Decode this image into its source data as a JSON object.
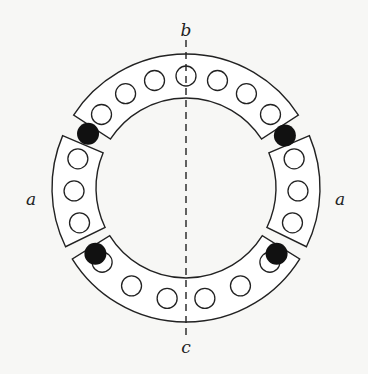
{
  "diagram": {
    "type": "rotor-stator cross-section",
    "center": [
      186,
      188
    ],
    "outer_radius": 134,
    "inner_radius": 90,
    "conductor_radius": 10,
    "conductor_ring_radius": 112,
    "stroke_color": "#222222",
    "fill_color": "#ffffff",
    "dot_color": "#111111",
    "segments": [
      {
        "name": "top",
        "start_deg": 33,
        "end_deg": 147,
        "conductors": 7
      },
      {
        "name": "left",
        "start_deg": 157,
        "end_deg": 206,
        "conductors": 3
      },
      {
        "name": "bottom",
        "start_deg": 212,
        "end_deg": 328,
        "conductors": 6
      },
      {
        "name": "right",
        "start_deg": -26,
        "end_deg": 23,
        "conductors": 3
      }
    ],
    "black_dots_deg": [
      28,
      151,
      216,
      324
    ],
    "axis": {
      "style": "dashed",
      "from_label": "b",
      "to_label": "c"
    },
    "labels": {
      "top": "b",
      "bottom": "c",
      "left": "a",
      "right": "a"
    }
  }
}
